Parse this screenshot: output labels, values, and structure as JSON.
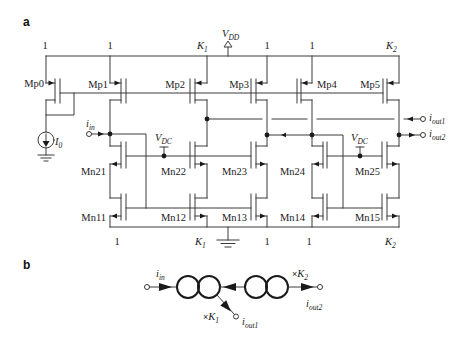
{
  "panel_labels": {
    "a": "a",
    "b": "b"
  },
  "circuit": {
    "supply": {
      "main": "V",
      "sub": "DD"
    },
    "bias_source": {
      "main": "I",
      "sub": "0"
    },
    "input": {
      "main": "i",
      "sub": "in"
    },
    "output1": {
      "main": "i",
      "sub": "out1"
    },
    "output2": {
      "main": "i",
      "sub": "out2"
    },
    "bias_voltage_left": {
      "main": "V",
      "sub": "DC"
    },
    "bias_voltage_right": {
      "main": "V",
      "sub": "DC"
    },
    "pmos": [
      "Mp0",
      "Mp1",
      "Mp2",
      "Mp3",
      "Mp4",
      "Mp5"
    ],
    "nmos_cascode": [
      "Mn21",
      "Mn22",
      "Mn23",
      "Mn24",
      "Mn25"
    ],
    "nmos_mirror": [
      "Mn11",
      "Mn12",
      "Mn13",
      "Mn14",
      "Mn15"
    ],
    "top_ratios": [
      {
        "main": "1",
        "sub": ""
      },
      {
        "main": "1",
        "sub": ""
      },
      {
        "main": "K",
        "sub": "1"
      },
      {
        "main": "1",
        "sub": ""
      },
      {
        "main": "1",
        "sub": ""
      },
      {
        "main": "K",
        "sub": "2"
      }
    ],
    "bottom_ratios": [
      {
        "main": "1",
        "sub": ""
      },
      {
        "main": "K",
        "sub": "1"
      },
      {
        "main": "1",
        "sub": ""
      },
      {
        "main": "1",
        "sub": ""
      },
      {
        "main": "K",
        "sub": "2"
      }
    ]
  },
  "block_diagram": {
    "input": {
      "main": "i",
      "sub": "in"
    },
    "output1": {
      "main": "i",
      "sub": "out1"
    },
    "output2": {
      "main": "i",
      "sub": "out2"
    },
    "gain1": {
      "prefix": "×",
      "main": "K",
      "sub": "1"
    },
    "gain2": {
      "prefix": "×",
      "main": "K",
      "sub": "2"
    }
  }
}
